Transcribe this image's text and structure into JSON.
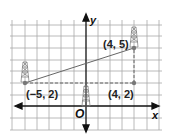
{
  "figure": {
    "axes": {
      "x_label": "x",
      "y_label": "y",
      "origin_label": "O"
    },
    "points": [
      {
        "id": "A",
        "label": "(−5, 2)",
        "x": -5,
        "y": 2,
        "tower": true
      },
      {
        "id": "B",
        "label": "(4, 5)",
        "x": 4,
        "y": 5,
        "tower": true
      },
      {
        "id": "C",
        "label": "(4, 2)",
        "x": 4,
        "y": 2,
        "tower": false
      }
    ],
    "center_tower": {
      "x": 0,
      "y": 1
    },
    "segments": [
      {
        "from": "A",
        "to": "B",
        "style": "solid"
      },
      {
        "from": "A",
        "to": "C",
        "style": "dashed"
      },
      {
        "from": "C",
        "to": "B",
        "style": "dashed"
      }
    ],
    "colors": {
      "grid": "#9a9a9a",
      "axis": "#111111",
      "line": "#666666",
      "point": "#777777",
      "tower": "#888888"
    }
  }
}
